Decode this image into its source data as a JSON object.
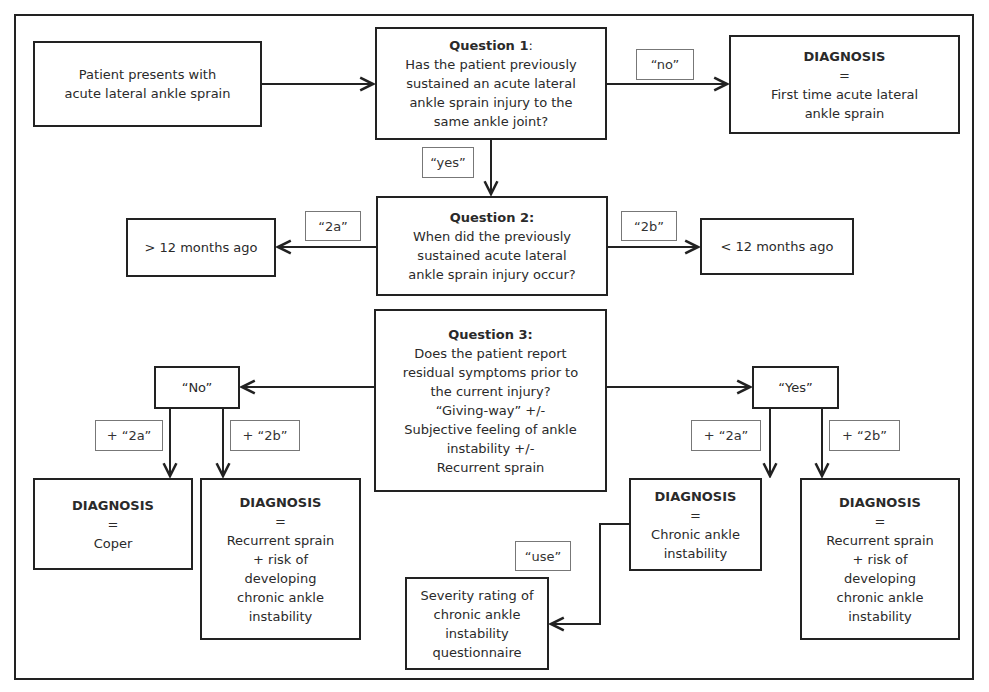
{
  "start": {
    "text": [
      "Patient presents with",
      "acute lateral ankle sprain"
    ]
  },
  "question1": {
    "title": "Question 1",
    "title_suffix": ":",
    "text": [
      "Has the patient previously",
      "sustained an acute lateral",
      "ankle sprain injury to the",
      "same ankle joint?"
    ]
  },
  "diagnosis_first_time": {
    "title": "DIAGNOSIS",
    "eq": "=",
    "text": [
      "First time acute lateral",
      "ankle sprain"
    ]
  },
  "labels": {
    "no": "“no”",
    "yes": "“yes”",
    "2a": "“2a”",
    "2b": "“2b”",
    "plus_2a_left": "+ “2a”",
    "plus_2b_left": "+ “2b”",
    "plus_2a_right": "+ “2a”",
    "plus_2b_right": "+ “2b”",
    "use": "“use”"
  },
  "question2": {
    "title": "Question 2:",
    "text": [
      "When did the previously",
      "sustained acute lateral",
      "ankle sprain injury occur?"
    ]
  },
  "more_than_12": {
    "text": "> 12 months ago"
  },
  "less_than_12": {
    "text": "< 12 months ago"
  },
  "question3": {
    "title": "Question 3:",
    "text": [
      "Does the patient report",
      "residual symptoms prior to",
      "the current injury?",
      "“Giving-way” +/-",
      "Subjective feeling of ankle",
      "instability +/-",
      "Recurrent sprain"
    ]
  },
  "answer_no": {
    "text": "“No”"
  },
  "answer_yes": {
    "text": "“Yes”"
  },
  "diagnosis_coper": {
    "title": "DIAGNOSIS",
    "eq": "=",
    "text": [
      "Coper"
    ]
  },
  "diagnosis_recurrent_left": {
    "title": "DIAGNOSIS",
    "eq": "=",
    "text": [
      "Recurrent sprain",
      "+ risk of",
      "developing",
      "chronic ankle",
      "instability"
    ]
  },
  "diagnosis_cai": {
    "title": "DIAGNOSIS",
    "eq": "=",
    "text": [
      "Chronic ankle",
      "instability"
    ]
  },
  "diagnosis_recurrent_right": {
    "title": "DIAGNOSIS",
    "eq": "=",
    "text": [
      "Recurrent sprain",
      "+ risk of",
      "developing",
      "chronic ankle",
      "instability"
    ]
  },
  "severity": {
    "text": [
      "Severity rating of",
      "chronic ankle",
      "instability",
      "questionnaire"
    ]
  }
}
